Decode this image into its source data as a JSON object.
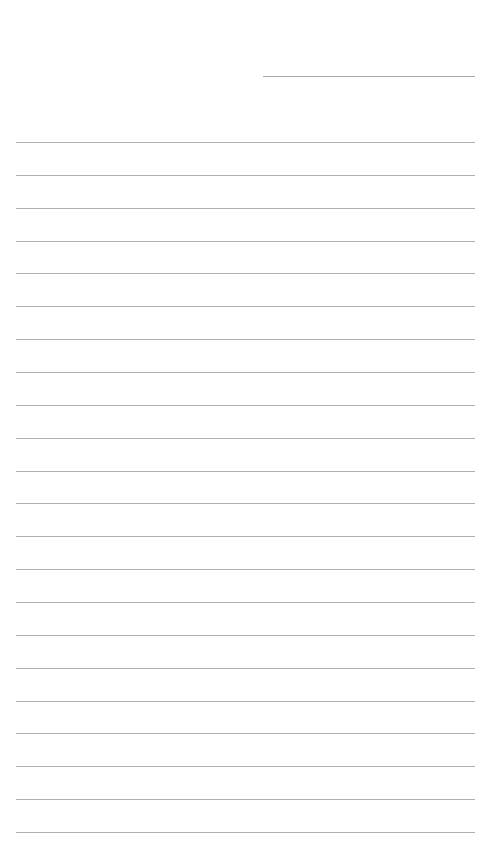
{
  "page": {
    "type": "lined-paper",
    "background": "#ffffff",
    "line_color": "#b0b0b0"
  },
  "header_line": {
    "left": 263,
    "right": 475,
    "top": 76,
    "color": "#a9a9a9"
  },
  "rules": {
    "left": 16,
    "right": 475,
    "first_top": 142,
    "spacing": 32.86,
    "count": 22
  }
}
